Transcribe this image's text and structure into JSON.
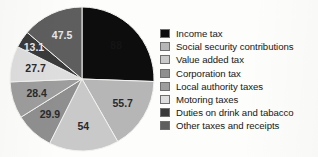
{
  "chart_data": {
    "type": "pie",
    "title": "",
    "subtitle": "",
    "xlabel": "",
    "ylabel": "",
    "legend_position": "right",
    "grid": false,
    "start_angle_deg": 0,
    "direction": "clockwise",
    "categories": [
      "Income tax",
      "Social security contributions",
      "Value added tax",
      "Corporation tax",
      "Local authority taxes",
      "Motoring taxes",
      "Duties on drink and tabacco",
      "Other taxes and receipts"
    ],
    "values": [
      88,
      55.7,
      54,
      29.9,
      28.4,
      27.7,
      13.1,
      47.5
    ],
    "value_labels": [
      "88",
      "55.7",
      "54",
      "29.9",
      "28.4",
      "27.7",
      "13.1",
      "47.5"
    ],
    "colors": [
      "#0d0d0d",
      "#b6b6b6",
      "#c9c9c9",
      "#8f8f8f",
      "#9d9d9d",
      "#dedede",
      "#3a3a3a",
      "#5e5e5e"
    ],
    "total": 344.3
  },
  "legend": {
    "items": [
      {
        "label": "Income tax",
        "color": "#0d0d0d",
        "value": "88"
      },
      {
        "label": "Social security contributions",
        "color": "#b6b6b6",
        "value": "55.7"
      },
      {
        "label": "Value added tax",
        "color": "#c9c9c9",
        "value": "54"
      },
      {
        "label": "Corporation tax",
        "color": "#8f8f8f",
        "value": "29.9"
      },
      {
        "label": "Local authority taxes",
        "color": "#9d9d9d",
        "value": "28.4"
      },
      {
        "label": "Motoring taxes",
        "color": "#dedede",
        "value": "27.7"
      },
      {
        "label": "Duties on drink and tabacco",
        "color": "#3a3a3a",
        "value": "13.1"
      },
      {
        "label": "Other taxes and receipts",
        "color": "#5e5e5e",
        "value": "47.5"
      }
    ]
  },
  "figure": {
    "background_color": "#fdfdfc",
    "slice_edge_color": "#f2f2f0"
  }
}
